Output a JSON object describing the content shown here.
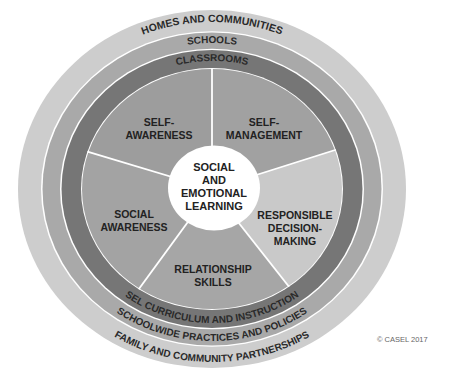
{
  "diagram": {
    "rings": {
      "outer_top": "HOMES AND COMMUNITIES",
      "middle_top": "SCHOOLS",
      "inner_top": "CLASSROOMS",
      "inner_bottom": "SEL CURRICULUM AND INSTRUCTION",
      "middle_bottom": "SCHOOLWIDE PRACTICES AND POLICIES",
      "outer_bottom": "FAMILY AND COMMUNITY PARTNERSHIPS"
    },
    "center": {
      "lines": [
        "SOCIAL",
        "AND",
        "EMOTIONAL",
        "LEARNING"
      ]
    },
    "competencies": [
      {
        "lines": [
          "SELF-",
          "AWARENESS"
        ]
      },
      {
        "lines": [
          "SELF-",
          "MANAGEMENT"
        ]
      },
      {
        "lines": [
          "RESPONSIBLE",
          "DECISION-",
          "MAKING"
        ]
      },
      {
        "lines": [
          "RELATIONSHIP",
          "SKILLS"
        ]
      },
      {
        "lines": [
          "SOCIAL",
          "AWARENESS"
        ]
      }
    ],
    "colors": {
      "outer_ring": "#cdcdcd",
      "schools_ring": "#a9a9a9",
      "classrooms_ring": "#767676",
      "self_awareness": "#9d9d9d",
      "self_management": "#a1a1a1",
      "responsible_decision_making": "#c9c9c9",
      "relationship_skills": "#a6a6a6",
      "social_awareness": "#a3a3a3",
      "center": "#ffffff",
      "divider": "#ffffff"
    }
  },
  "copyright": "© CASEL 2017"
}
